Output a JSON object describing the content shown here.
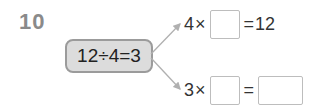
{
  "problem": {
    "number": "10",
    "given_equation": "12÷4=3",
    "branches": [
      {
        "factor": "4",
        "times": "×",
        "blank": "",
        "equals": "=",
        "result": "12"
      },
      {
        "factor": "3",
        "times": "×",
        "blank": "",
        "equals": "=",
        "result_blank": ""
      }
    ]
  },
  "colors": {
    "number": "#8a8a8a",
    "pill_fill": "#dcdcdc",
    "pill_border": "#9b9b9b",
    "arrow": "#b0b0b0",
    "box_border": "#bdbdbd"
  }
}
